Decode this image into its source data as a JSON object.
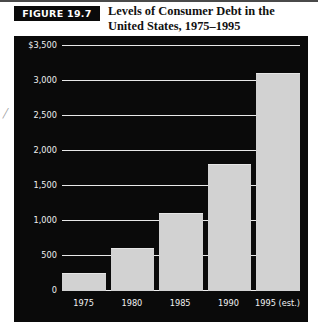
{
  "header": {
    "figure_badge": "FIGURE 19.7",
    "title_line1": "Levels of Consumer Debt in the",
    "title_line2": "United States, 1975–1995"
  },
  "artifact": {
    "mark": "/"
  },
  "colors": {
    "panel_background": "#0a0a0a",
    "bar_fill": "#d2d2d2",
    "gridline": "#e8e8e8",
    "tick_text": "#f0f0f0",
    "badge_background": "#0a0a0a",
    "badge_text": "#ffffff"
  },
  "chart_data": {
    "type": "bar",
    "title": "Levels of Consumer Debt in the United States, 1975–1995",
    "xlabel": "",
    "ylabel": "",
    "categories": [
      "1975",
      "1980",
      "1985",
      "1990",
      "1995 (est.)"
    ],
    "values": [
      250,
      600,
      1100,
      1800,
      3100
    ],
    "ylim": [
      0,
      3500
    ],
    "yticks": [
      0,
      500,
      1000,
      1500,
      2000,
      2500,
      3000,
      3500
    ],
    "ytick_labels": [
      "0",
      "500",
      "1,000",
      "1,500",
      "2,000",
      "2,500",
      "3,000",
      "$3,500"
    ],
    "grid": true,
    "legend": "none"
  }
}
